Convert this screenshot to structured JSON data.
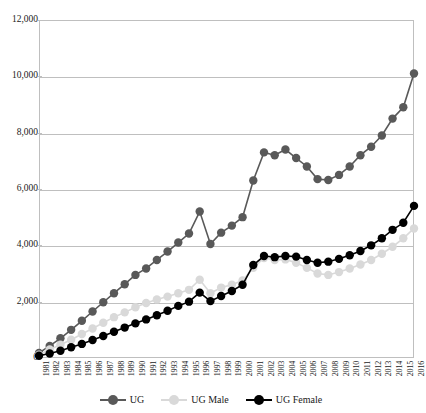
{
  "chart_data": {
    "type": "line",
    "title": "",
    "xlabel": "",
    "ylabel": "",
    "ylim": [
      0,
      12000
    ],
    "ytick_values": [
      0,
      2000,
      4000,
      6000,
      8000,
      10000,
      12000
    ],
    "ytick_labels": [
      "0",
      "2,000",
      "4,000",
      "6,000",
      "8,000",
      "10,000",
      "12,000"
    ],
    "grid": true,
    "legend_position": "bottom",
    "x": [
      "1981",
      "1982",
      "1983",
      "1984",
      "1985",
      "1986",
      "1987",
      "1988",
      "1989",
      "1990",
      "1991",
      "1992",
      "1993",
      "1994",
      "1995",
      "1996",
      "1997",
      "1998",
      "1999",
      "2000",
      "2001",
      "2002",
      "2003",
      "2004",
      "2005",
      "2006",
      "2007",
      "2008",
      "2009",
      "2010",
      "2011",
      "2012",
      "2013",
      "2014",
      "2015",
      "2016"
    ],
    "series": [
      {
        "name": "UG",
        "color": "#595959",
        "values": [
          180,
          430,
          700,
          1000,
          1320,
          1650,
          1980,
          2300,
          2620,
          2950,
          3180,
          3480,
          3780,
          4100,
          4420,
          5200,
          4050,
          4450,
          4700,
          5000,
          6300,
          7300,
          7200,
          7400,
          7100,
          6800,
          6350,
          6320,
          6500,
          6800,
          7200,
          7500,
          7900,
          8500,
          8900,
          10100
        ]
      },
      {
        "name": "UG Male",
        "color": "#d9d9d9",
        "values": [
          120,
          300,
          470,
          650,
          850,
          1050,
          1250,
          1450,
          1620,
          1800,
          1950,
          2080,
          2180,
          2300,
          2420,
          2780,
          2300,
          2500,
          2600,
          2750,
          3200,
          3550,
          3480,
          3500,
          3380,
          3200,
          3000,
          2950,
          3050,
          3180,
          3320,
          3480,
          3700,
          3950,
          4250,
          4600
        ]
      },
      {
        "name": "UG Female",
        "color": "#000000",
        "values": [
          80,
          160,
          260,
          380,
          500,
          640,
          780,
          930,
          1080,
          1230,
          1370,
          1520,
          1680,
          1850,
          2000,
          2320,
          2020,
          2200,
          2380,
          2600,
          3300,
          3620,
          3580,
          3620,
          3600,
          3480,
          3380,
          3420,
          3520,
          3650,
          3800,
          4000,
          4250,
          4550,
          4800,
          5400
        ]
      }
    ]
  }
}
